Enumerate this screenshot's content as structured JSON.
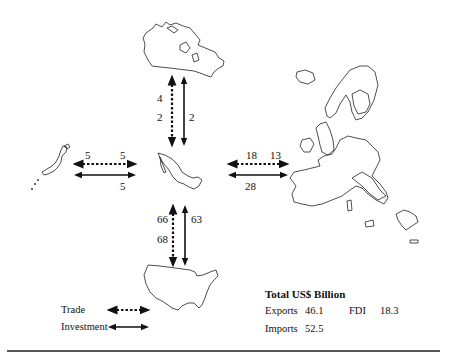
{
  "diagram": {
    "center_country": "Mexico",
    "partners": [
      {
        "name": "Canada",
        "position": "top",
        "trade_values": [
          "4",
          "2"
        ],
        "investment_value": "2"
      },
      {
        "name": "Japan",
        "position": "left",
        "trade_values": [
          "5",
          "5"
        ],
        "investment_value": "5"
      },
      {
        "name": "European Union",
        "position": "right",
        "trade_values": [
          "18",
          "13"
        ],
        "investment_value": "28"
      },
      {
        "name": "United States",
        "position": "bottom",
        "trade_values": [
          "66",
          "68"
        ],
        "investment_value": "63"
      }
    ]
  },
  "legend": {
    "trade_label": "Trade",
    "investment_label": "Investment",
    "trade_style": "dotted-double-arrow",
    "investment_style": "solid-double-arrow"
  },
  "totals": {
    "title": "Total US$ Billion",
    "exports_label": "Exports",
    "exports_value": "46.1",
    "fdi_label": "FDI",
    "fdi_value": "18.3",
    "imports_label": "Imports",
    "imports_value": "52.5"
  },
  "colors": {
    "ink": "#111111",
    "rule": "#555555",
    "background": "#ffffff"
  }
}
